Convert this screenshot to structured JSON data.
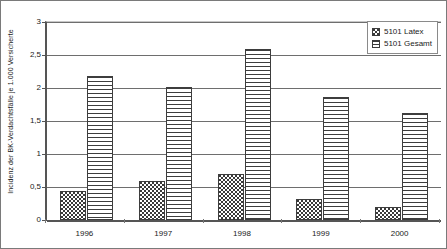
{
  "chart_data": {
    "type": "bar",
    "title": "",
    "xlabel": "",
    "ylabel": "Incidenz der BK-Verdachtsfälle je 1.000 Versicherte",
    "categories": [
      "1996",
      "1997",
      "1998",
      "1999",
      "2000"
    ],
    "series": [
      {
        "name": "5101 Latex",
        "pattern": "dotted",
        "values": [
          0.44,
          0.59,
          0.69,
          0.32,
          0.2
        ]
      },
      {
        "name": "5101 Gesamt",
        "pattern": "horizontal-lines",
        "values": [
          2.18,
          2.02,
          2.59,
          1.86,
          1.62
        ]
      }
    ],
    "ylim": [
      0,
      3
    ],
    "ytick_values": [
      0,
      0.5,
      1,
      1.5,
      2,
      2.5,
      3
    ],
    "ytick_labels": [
      "0",
      "0,5",
      "1",
      "1,5",
      "2",
      "2,5",
      "3"
    ],
    "grid": true,
    "legend_position": "top-right",
    "colors": {
      "axis": "#555555",
      "gridline": "#6e6e6e",
      "bar_outline": "#3d3d3d",
      "pattern": "#3a3a3a",
      "plot_background": "#ffffff",
      "frame": "#7a7a7a"
    }
  },
  "legend": {
    "items": [
      {
        "label": "5101 Latex"
      },
      {
        "label": "5101 Gesamt"
      }
    ]
  }
}
